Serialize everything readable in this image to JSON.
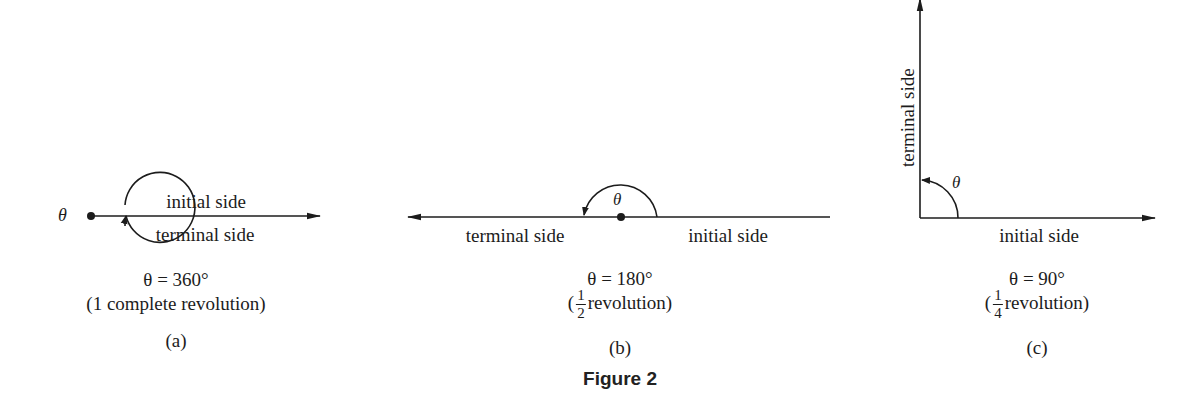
{
  "figure": {
    "title": "Figure 2",
    "colors": {
      "ink": "#1c1c1c",
      "background": "#ffffff"
    }
  },
  "panels": [
    {
      "id": "a",
      "caption": "(a)",
      "theta_symbol": "θ",
      "initial_label": "initial side",
      "terminal_label": "terminal side",
      "equation": "θ = 360°",
      "description": "(1 complete revolution)"
    },
    {
      "id": "b",
      "caption": "(b)",
      "theta_symbol": "θ",
      "initial_label": "initial side",
      "terminal_label": "terminal side",
      "equation": "θ = 180°",
      "desc_open": "(",
      "frac_num": "1",
      "frac_den": "2",
      "desc_rest": "revolution)"
    },
    {
      "id": "c",
      "caption": "(c)",
      "theta_symbol": "θ",
      "initial_label": "initial side",
      "terminal_label": "terminal side",
      "equation": "θ = 90°",
      "desc_open": "(",
      "frac_num": "1",
      "frac_den": "4",
      "desc_rest": "revolution)"
    }
  ]
}
